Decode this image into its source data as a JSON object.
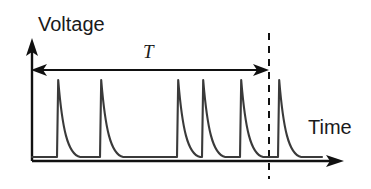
{
  "figure": {
    "title": "",
    "y_axis_label": "Voltage",
    "x_axis_label": "Time",
    "period_label": "T",
    "line_color": "#3a3a3a",
    "axis_color": "#111111",
    "text_color": "#1a1a1a",
    "background_color": "#ffffff"
  },
  "chart_data": {
    "type": "line",
    "title": "",
    "subtitle": "",
    "xlabel": "Time",
    "ylabel": "Voltage",
    "xlim": [
      0,
      371
    ],
    "ylim": [
      0,
      1
    ],
    "grid": false,
    "legend": "none",
    "annotations": [
      {
        "name": "period-arrow",
        "label": "T",
        "kind": "double-headed-arrow",
        "x_start": 32,
        "x_end": 268,
        "y": 70,
        "label_x": 149,
        "label_y": 58
      },
      {
        "name": "period-end-marker",
        "label": "",
        "kind": "dashed-vertical-line",
        "x": 269,
        "y_start": 33,
        "y_end": 179
      }
    ],
    "series": [
      {
        "name": "voltage-spike-train",
        "description": "Periodic train of sharp voltage spikes with fast rise and exponential decay, returning to a flat baseline between spikes.",
        "baseline_y": 157,
        "peak_y": 80,
        "spike_x": [
          57,
          100,
          177,
          202,
          240,
          278
        ],
        "values": [
          1,
          1,
          1,
          1,
          1,
          1
        ],
        "decay_width": 22
      }
    ]
  },
  "axes": {
    "y_axis": {
      "x": 32,
      "y_top": 41,
      "y_bottom": 161,
      "arrow": "up"
    },
    "x_axis": {
      "y": 161,
      "x_left": 32,
      "x_right": 344,
      "arrow": "right"
    }
  }
}
